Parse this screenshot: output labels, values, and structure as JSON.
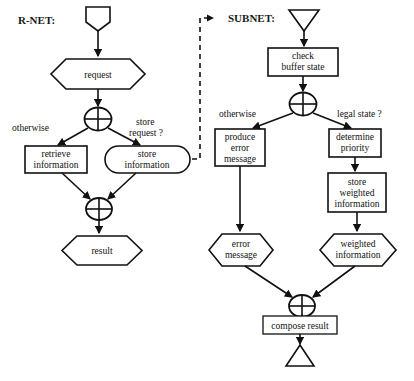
{
  "diagram": {
    "type": "flowchart",
    "title_left": "R-NET:",
    "title_right": "SUBNET:",
    "colors": {
      "stroke": "#111111",
      "fill": "#ffffff",
      "background": "#ffffff"
    },
    "left_net": {
      "label": "R-NET:",
      "start_symbol": "pentagon-input",
      "nodes": [
        {
          "id": "request",
          "shape": "hexagon",
          "text": "request"
        },
        {
          "id": "xor-split",
          "shape": "xor",
          "text": ""
        },
        {
          "id": "retrieve-information",
          "shape": "rectangle",
          "lines": [
            "retrieve",
            "information"
          ]
        },
        {
          "id": "store-information",
          "shape": "stadium",
          "lines": [
            "store",
            "information"
          ]
        },
        {
          "id": "xor-merge",
          "shape": "xor",
          "text": ""
        },
        {
          "id": "result",
          "shape": "hexagon",
          "text": "result"
        }
      ],
      "edge_labels": [
        {
          "id": "otherwise-left",
          "text": "otherwise"
        },
        {
          "id": "store-request",
          "lines": [
            "store",
            "request ?"
          ]
        }
      ]
    },
    "right_net": {
      "label": "SUBNET:",
      "start_symbol": "triangle-down",
      "end_symbol": "triangle-up",
      "nodes": [
        {
          "id": "check-buffer-state",
          "shape": "rectangle",
          "lines": [
            "check",
            "buffer state"
          ]
        },
        {
          "id": "xor-split-sub",
          "shape": "xor",
          "text": ""
        },
        {
          "id": "produce-error-message",
          "shape": "rectangle",
          "lines": [
            "produce",
            "error",
            "message"
          ]
        },
        {
          "id": "determine-priority",
          "shape": "rectangle",
          "lines": [
            "determine",
            "priority"
          ]
        },
        {
          "id": "store-weighted-information",
          "shape": "rectangle",
          "lines": [
            "store",
            "weighted",
            "information"
          ]
        },
        {
          "id": "error-message",
          "shape": "hexagon",
          "lines": [
            "error",
            "message"
          ]
        },
        {
          "id": "weighted-information",
          "shape": "hexagon",
          "lines": [
            "weighted",
            "information"
          ]
        },
        {
          "id": "xor-merge-sub",
          "shape": "xor",
          "text": ""
        },
        {
          "id": "compose-result",
          "shape": "rectangle",
          "text": "compose result"
        }
      ],
      "edge_labels": [
        {
          "id": "otherwise-right",
          "text": "otherwise"
        },
        {
          "id": "legal-state",
          "text": "legal state ?"
        }
      ]
    },
    "link": {
      "id": "subnet-refinement-link",
      "style": "dashed-arrow",
      "from": "store-information",
      "to": "SUBNET:"
    }
  }
}
